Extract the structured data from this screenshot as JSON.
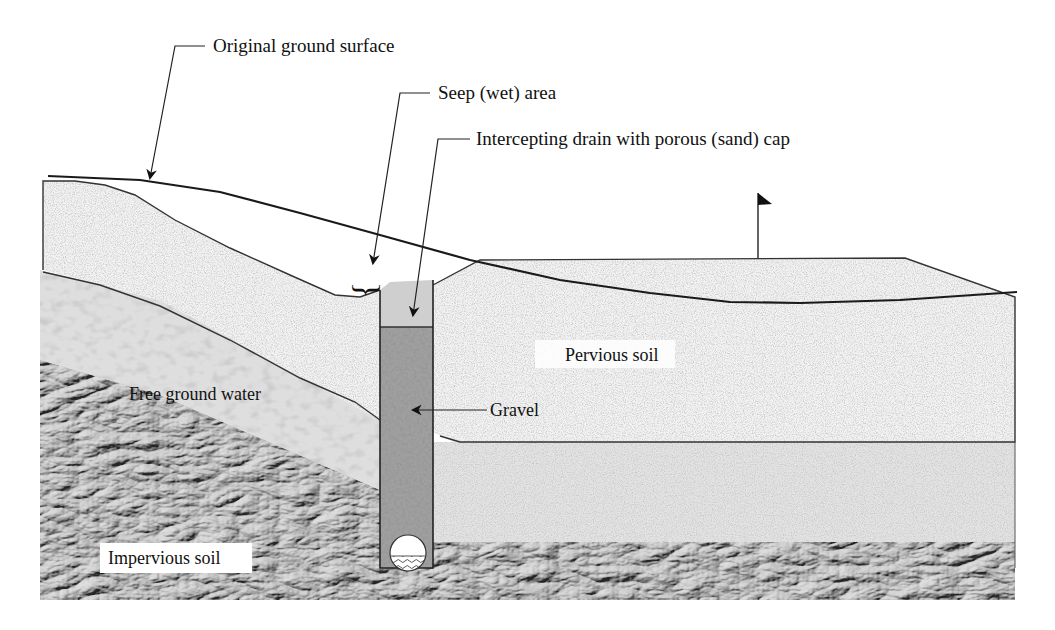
{
  "figure": {
    "type": "geotechnical cross-section"
  },
  "labels": {
    "original_ground_surface": "Original ground surface",
    "seep_area": "Seep (wet) area",
    "intercepting_drain": "Intercepting drain with porous (sand) cap",
    "pervious_soil": "Pervious soil",
    "free_ground_water": "Free ground water",
    "gravel": "Gravel",
    "impervious_soil": "Impervious soil"
  },
  "layers": [
    {
      "name": "Pervious soil",
      "pattern": "fine-speckle",
      "color": "#ededed"
    },
    {
      "name": "Free ground water zone",
      "pattern": "pebbled",
      "color": "#dcdcdc"
    },
    {
      "name": "Impervious soil",
      "pattern": "crumpled-rock",
      "color": "#7a7a7a"
    },
    {
      "name": "Gravel",
      "pattern": "coarse-speckle",
      "color": "#9a9a9a"
    },
    {
      "name": "Sand cap",
      "pattern": "flat",
      "color": "#d0d0d0"
    }
  ],
  "icons": {
    "flag": "flag-icon",
    "pipe": "perforated-drain-pipe-icon",
    "brace": "curly-brace-icon"
  }
}
